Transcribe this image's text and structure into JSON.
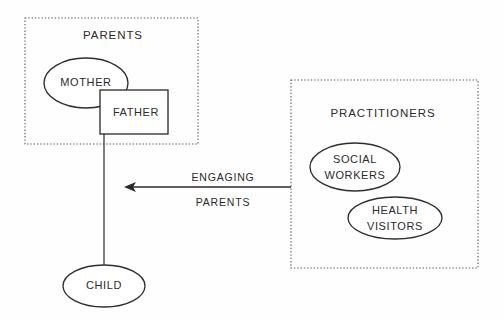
{
  "diagram": {
    "background_color": "#fefefe",
    "stroke_color": "#2e2e2e",
    "dotted_color": "#5a5a5a",
    "groups": [
      {
        "id": "parents",
        "label": "PARENTS",
        "border_style": "dotted",
        "x": 25,
        "y": 18,
        "width": 173,
        "height": 126,
        "label_x": 113,
        "label_y": 36
      },
      {
        "id": "practitioners",
        "label": "PRACTITIONERS",
        "border_style": "dotted",
        "x": 291,
        "y": 80,
        "width": 187,
        "height": 188,
        "label_x": 383,
        "label_y": 114
      }
    ],
    "nodes": [
      {
        "id": "mother",
        "label": "MOTHER",
        "shape": "ellipse",
        "cx": 86,
        "cy": 83,
        "rx": 42,
        "ry": 25,
        "lines": [
          "MOTHER"
        ]
      },
      {
        "id": "father",
        "label": "FATHER",
        "shape": "rect",
        "x": 100,
        "y": 90,
        "width": 68,
        "height": 44,
        "cx": 134,
        "cy": 112,
        "lines": [
          "FATHER"
        ]
      },
      {
        "id": "child",
        "label": "CHILD",
        "shape": "ellipse",
        "cx": 104,
        "cy": 286,
        "rx": 41,
        "ry": 21,
        "lines": [
          "CHILD"
        ]
      },
      {
        "id": "social-workers",
        "label": "SOCIAL WORKERS",
        "shape": "ellipse",
        "cx": 355,
        "cy": 167,
        "rx": 45,
        "ry": 24,
        "lines": [
          "SOCIAL",
          "WORKERS"
        ]
      },
      {
        "id": "health-visitors",
        "label": "HEALTH VISITORS",
        "shape": "ellipse",
        "cx": 395,
        "cy": 218,
        "rx": 47,
        "ry": 21,
        "lines": [
          "HEALTH",
          "VISITORS"
        ]
      }
    ],
    "connectors": [
      {
        "id": "father-to-child",
        "from": "father",
        "to": "child",
        "type": "line",
        "x1": 104,
        "y1": 92,
        "x2": 104,
        "y2": 266
      }
    ],
    "arrows": [
      {
        "id": "engaging-parents-arrow",
        "from": "practitioners",
        "to": "family",
        "direction": "left",
        "x1": 291,
        "y1": 187,
        "x2": 124,
        "y2": 187,
        "label_lines": [
          "ENGAGING",
          "PARENTS"
        ],
        "label_x": 223,
        "label_line1_y": 178,
        "label_line2_y": 203
      }
    ]
  }
}
